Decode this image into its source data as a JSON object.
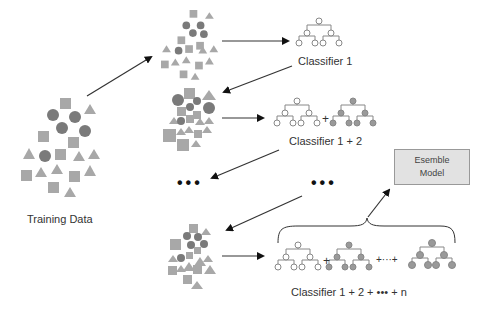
{
  "diagram": {
    "training_data": {
      "label": "Training Data"
    },
    "stages": [
      {
        "id": "stage-1",
        "classifier_label": "Classifier 1",
        "num_trees": 1
      },
      {
        "id": "stage-2",
        "classifier_label": "Classifier 1 + 2",
        "num_trees": 2
      },
      {
        "id": "stage-n",
        "classifier_label": "Classifier 1 + 2 + ••• + n",
        "num_trees": 3
      }
    ],
    "ellipsis": "•••",
    "plus_sign": "+",
    "plus_ellipsis": "+···+",
    "ensemble_box": {
      "line1": "Esemble",
      "line2": "Model"
    },
    "colors": {
      "shape_fill": "#a8a8a8",
      "circle_fill": "#7a7a7a",
      "tree_line": "#888888",
      "tree_node_open": "#ffffff",
      "tree_node_filled": "#999999",
      "arrow": "#333333",
      "box_fill": "#e2e2e2",
      "box_border": "#999999"
    }
  }
}
